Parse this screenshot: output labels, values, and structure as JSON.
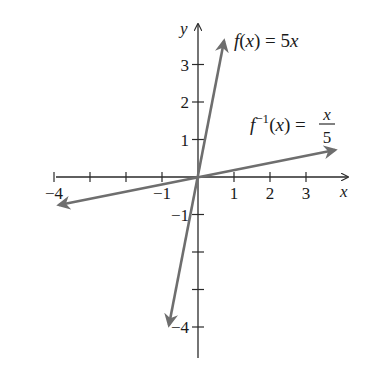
{
  "chart_data": {
    "type": "line",
    "title": "",
    "xlabel": "x",
    "ylabel": "y",
    "xlim": [
      -4,
      4
    ],
    "ylim": [
      -4,
      4
    ],
    "grid": false,
    "x_ticks": [
      -4,
      -3,
      -2,
      -1,
      1,
      2,
      3
    ],
    "x_tick_labels": [
      {
        "value": -4,
        "label": "−4"
      },
      {
        "value": -1,
        "label": "−1"
      },
      {
        "value": 1,
        "label": "1"
      },
      {
        "value": 2,
        "label": "2"
      },
      {
        "value": 3,
        "label": "3"
      }
    ],
    "y_ticks": [
      -4,
      -3,
      -2,
      -1,
      1,
      2,
      3
    ],
    "y_tick_labels": [
      {
        "value": 3,
        "label": "3"
      },
      {
        "value": 2,
        "label": "2"
      },
      {
        "value": 1,
        "label": "1"
      },
      {
        "value": -1,
        "label": "−1"
      },
      {
        "value": -4,
        "label": "−4"
      }
    ],
    "series": [
      {
        "name": "f(x) = 5x",
        "label_main": "f(x) = 5x",
        "equation": "y = 5x",
        "x": [
          -0.8,
          0,
          0.75
        ],
        "y": [
          -4,
          0,
          3.75
        ],
        "color": "#6e6e6e"
      },
      {
        "name": "f^{-1}(x) = x/5",
        "label_parts": {
          "f": "f",
          "sup": "−1",
          "rest": "(x) = ",
          "num": "x",
          "den": "5"
        },
        "equation": "y = x/5",
        "x": [
          -3.9,
          0,
          3.8
        ],
        "y": [
          -0.78,
          0,
          0.76
        ],
        "color": "#6e6e6e"
      }
    ],
    "colors": {
      "axis": "#2a2a2a",
      "curve": "#6e6e6e",
      "text": "#1a1a1a"
    }
  }
}
